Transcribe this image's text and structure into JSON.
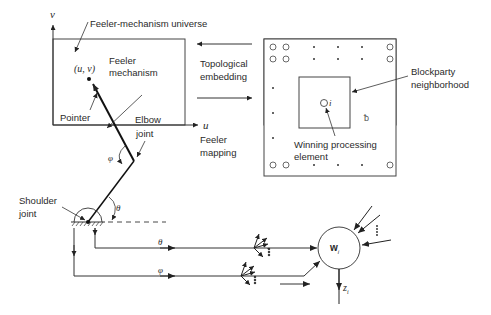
{
  "diagram": {
    "universe_label": "Feeler-mechanism universe",
    "axis_u": "u",
    "axis_v": "v",
    "point_label": "(u, v)",
    "feeler_mechanism_label_1": "Feeler",
    "feeler_mechanism_label_2": "mechanism",
    "pointer_label": "Pointer",
    "elbow_label_1": "Elbow",
    "elbow_label_2": "joint",
    "phi": "φ",
    "theta": "θ",
    "shoulder_label_1": "Shoulder",
    "shoulder_label_2": "joint",
    "topological_label_1": "Topological",
    "topological_label_2": "embedding",
    "feeler_mapping_label_1": "Feeler",
    "feeler_mapping_label_2": "mapping",
    "blockparty_label_1": "Blockparty",
    "blockparty_label_2": "neighborhood",
    "winning_label_1": "Winning processing",
    "winning_label_2": "element",
    "pe_index": "i",
    "weight_label": "w",
    "weight_sub": "i",
    "output_label": "z",
    "output_sub": "i",
    "line_theta": "θ",
    "line_phi": "φ"
  }
}
